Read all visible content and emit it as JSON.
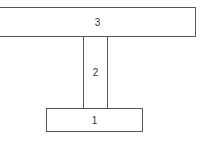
{
  "diagram": {
    "blocks": [
      {
        "label": "3",
        "position": "top"
      },
      {
        "label": "2",
        "position": "middle"
      },
      {
        "label": "1",
        "position": "bottom"
      }
    ],
    "colors": {
      "stroke": "#555555",
      "fill": "#ffffff",
      "text": "#333333"
    }
  }
}
